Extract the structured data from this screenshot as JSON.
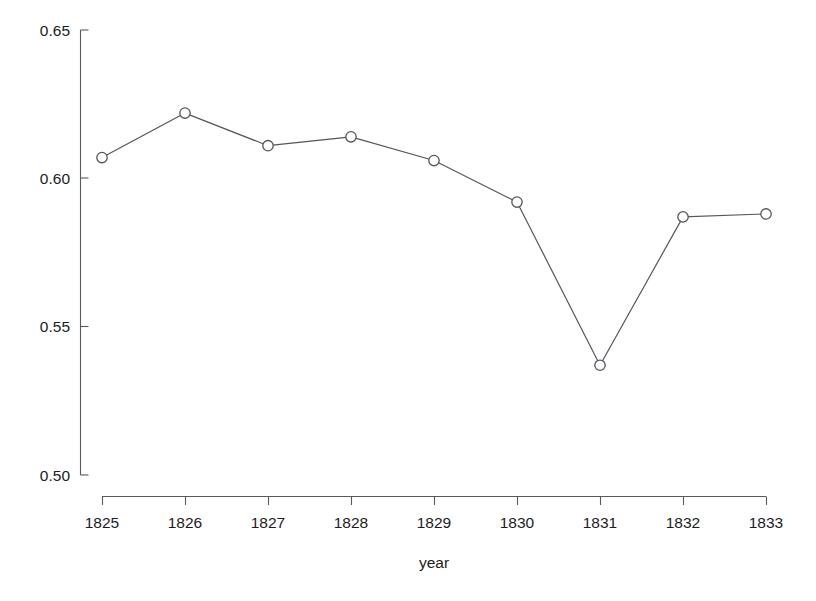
{
  "chart_data": {
    "type": "line",
    "title": "",
    "subtitle": "",
    "xlabel": "year",
    "ylabel": "",
    "x": [
      1825,
      1826,
      1827,
      1828,
      1829,
      1830,
      1831,
      1832,
      1833
    ],
    "values": [
      0.607,
      0.622,
      0.611,
      0.614,
      0.606,
      0.592,
      0.537,
      0.587,
      0.588
    ],
    "series": [
      {
        "name": "",
        "values": [
          0.607,
          0.622,
          0.611,
          0.614,
          0.606,
          0.592,
          0.537,
          0.587,
          0.588
        ]
      }
    ],
    "xticklabels": [
      "1825",
      "1826",
      "1827",
      "1828",
      "1829",
      "1830",
      "1831",
      "1832",
      "1833"
    ],
    "yticks": [
      0.5,
      0.55,
      0.6,
      0.65
    ],
    "yticklabels": [
      "0.50",
      "0.55",
      "0.60",
      "0.65"
    ],
    "xlim": [
      1824.6,
      1833.4
    ],
    "ylim": [
      0.5,
      0.65
    ],
    "grid": false,
    "legend": false,
    "legend_position": "none",
    "marker": "open-circle",
    "line_color": "#55555c",
    "marker_fill": "#ffffff",
    "background_color": "#ffffff",
    "axis_color": "#5a5a5a",
    "text_color": "#1c1c1c"
  }
}
